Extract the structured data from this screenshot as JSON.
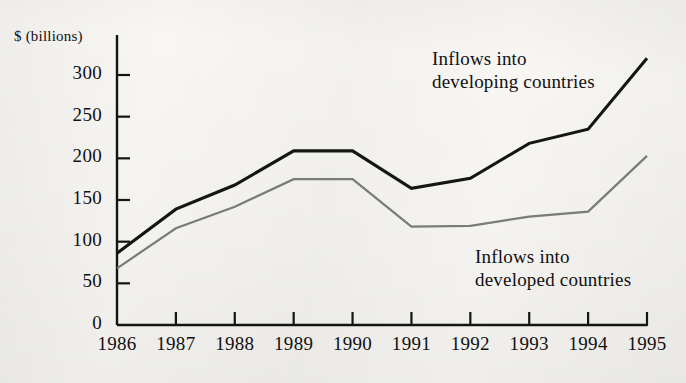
{
  "chart_data": {
    "type": "line",
    "title": "",
    "xlabel": "",
    "ylabel": "$ (billions)",
    "ylim": [
      0,
      330
    ],
    "yticks": [
      0,
      50,
      100,
      150,
      200,
      250,
      300
    ],
    "ytick_labels": [
      "0",
      "50",
      "100",
      "150",
      "200",
      "250",
      "300"
    ],
    "grid": false,
    "legend_position": "inline-annotations",
    "categories": [
      "1986",
      "1987",
      "1988",
      "1989",
      "1990",
      "1991",
      "1992",
      "1993",
      "1994",
      "1995"
    ],
    "x": [
      1986,
      1987,
      1988,
      1989,
      1990,
      1991,
      1992,
      1993,
      1994,
      1995
    ],
    "series": [
      {
        "name": "Inflows into developing countries",
        "color": "#151515",
        "line_width": 3.1,
        "values": [
          86,
          139,
          168,
          209,
          209,
          164,
          176,
          218,
          235,
          320
        ]
      },
      {
        "name": "Inflows into developed countries",
        "color": "#7d7d7d",
        "line_width": 2.2,
        "values": [
          68,
          116,
          142,
          175,
          175,
          118,
          119,
          130,
          136,
          203
        ]
      }
    ],
    "annotations": [
      {
        "id": "developing-annotation",
        "lines": [
          "Inflows into",
          "developing countries"
        ],
        "x_px": 432,
        "y_px": 47
      },
      {
        "id": "developed-annotation",
        "lines": [
          "Inflows into",
          "developed countries"
        ],
        "x_px": 475,
        "y_px": 245
      }
    ]
  },
  "axis": {
    "y_title": "$ (billions)"
  }
}
